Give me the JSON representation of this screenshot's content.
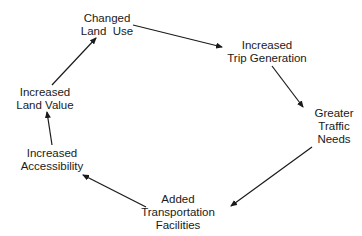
{
  "diagram": {
    "type": "cycle",
    "nodes": [
      {
        "id": "changed-land-use",
        "lines": [
          "Changed",
          "Land  Use"
        ],
        "x": 107,
        "y": 12
      },
      {
        "id": "increased-trip-generation",
        "lines": [
          "Increased",
          "Trip Generation"
        ],
        "x": 267,
        "y": 39
      },
      {
        "id": "greater-traffic-needs",
        "lines": [
          "Greater",
          "Traffic",
          "Needs"
        ],
        "x": 334,
        "y": 107
      },
      {
        "id": "added-transportation-facilities",
        "lines": [
          "Added",
          "Transportation",
          "Facilities"
        ],
        "x": 178,
        "y": 193
      },
      {
        "id": "increased-accessibility",
        "lines": [
          "Increased",
          "Accessibility"
        ],
        "x": 52,
        "y": 147
      },
      {
        "id": "increased-land-value",
        "lines": [
          "Increased",
          "Land Value"
        ],
        "x": 45,
        "y": 86
      }
    ],
    "edges": [
      {
        "from": "changed-land-use",
        "to": "increased-trip-generation",
        "x1": 133,
        "y1": 25,
        "x2": 222,
        "y2": 47
      },
      {
        "from": "increased-trip-generation",
        "to": "greater-traffic-needs",
        "x1": 272,
        "y1": 66,
        "x2": 303,
        "y2": 107
      },
      {
        "from": "greater-traffic-needs",
        "to": "added-transportation-facilities",
        "x1": 312,
        "y1": 147,
        "x2": 231,
        "y2": 206
      },
      {
        "from": "added-transportation-facilities",
        "to": "increased-accessibility",
        "x1": 146,
        "y1": 207,
        "x2": 83,
        "y2": 175
      },
      {
        "from": "increased-accessibility",
        "to": "increased-land-value",
        "x1": 52,
        "y1": 145,
        "x2": 47,
        "y2": 112
      },
      {
        "from": "increased-land-value",
        "to": "changed-land-use",
        "x1": 52,
        "y1": 85,
        "x2": 96,
        "y2": 38
      }
    ],
    "colors": {
      "line": "#1a1a1a",
      "text": "#1a1a1a",
      "background": "#ffffff"
    }
  }
}
